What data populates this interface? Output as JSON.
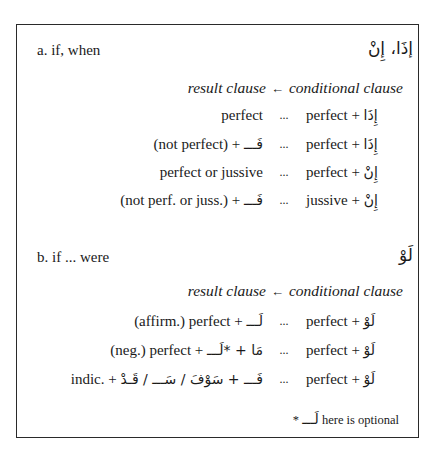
{
  "section_a": {
    "label": "a. if, when",
    "arabic_title": "إذَا، إِنْ",
    "header": {
      "result": "result clause",
      "arrow": "←",
      "conditional": "conditional clause"
    },
    "rows": [
      {
        "result_text": "perfect",
        "result_arabic": "",
        "separator": "...",
        "cond_text": "perfect + ",
        "cond_arabic": "إِذَا"
      },
      {
        "result_text": "(not perfect) + ",
        "result_arabic": "فَـــ",
        "separator": "...",
        "cond_text": "perfect + ",
        "cond_arabic": "إِذَا"
      },
      {
        "result_text": "perfect or jussive",
        "result_arabic": "",
        "separator": "...",
        "cond_text": "perfect + ",
        "cond_arabic": "إِنْ"
      },
      {
        "result_text": "(not perf. or juss.) + ",
        "result_arabic": "فَـــ",
        "separator": "...",
        "cond_text": "jussive + ",
        "cond_arabic": "إِنْ"
      }
    ]
  },
  "section_b": {
    "label": "b. if ... were",
    "arabic_title": "لَوْ",
    "header": {
      "result": "result clause",
      "arrow": "←",
      "conditional": "conditional clause"
    },
    "rows": [
      {
        "result_text": "(affirm.) perfect + ",
        "result_arabic": "لَـــ",
        "separator": "...",
        "cond_text": "perfect + ",
        "cond_arabic": "لَوْ"
      },
      {
        "result_text": "(neg.) perfect + ",
        "result_arabic": "مَا + *لَـــ",
        "separator": "...",
        "cond_text": "perfect + ",
        "cond_arabic": "لَوْ"
      },
      {
        "result_text": "indic. + ",
        "result_arabic": "فَـــ + سَوْفَ / سَـــ / قَـدْ",
        "separator": "...",
        "cond_text": "perfect + ",
        "cond_arabic": "لَوْ"
      }
    ],
    "footnote": {
      "marker": "*",
      "arabic": "لَـــ",
      "text": " here is optional"
    }
  }
}
